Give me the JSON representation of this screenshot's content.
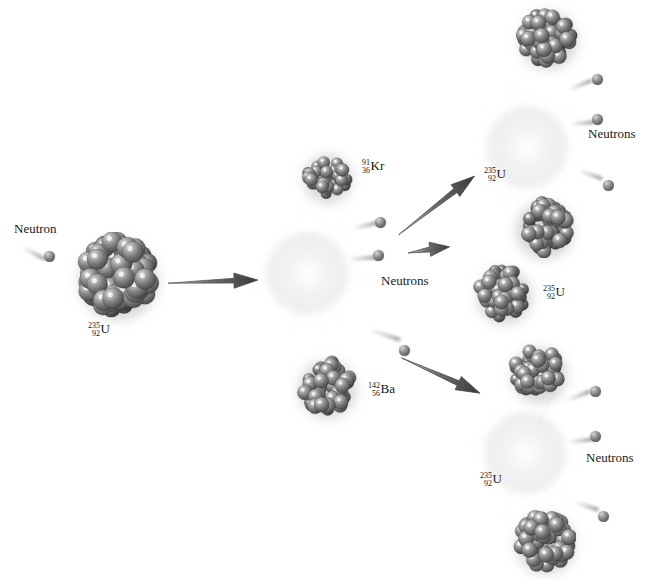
{
  "diagram": {
    "background_color": "#ffffff",
    "nucleus_color": "#6f6f6f",
    "neutron_color": "#7a7a7a",
    "burst_color": "#e6e6e6",
    "text_color": "#1a1a1a"
  },
  "labels": {
    "neutron_incoming": "Neutron",
    "neutrons_center": "Neutrons",
    "neutrons_top_right": "Neutrons",
    "neutrons_bottom_right": "Neutrons"
  },
  "isotopes": {
    "u235_source": {
      "mass": "235",
      "atomic": "92",
      "symbol": "U"
    },
    "kr91": {
      "mass": "91",
      "atomic": "36",
      "symbol": "Kr"
    },
    "ba142": {
      "mass": "142",
      "atomic": "56",
      "symbol": "Ba"
    },
    "u235_top": {
      "mass": "235",
      "atomic": "92",
      "symbol": "U"
    },
    "u235_middle": {
      "mass": "235",
      "atomic": "92",
      "symbol": "U"
    },
    "u235_bottom": {
      "mass": "235",
      "atomic": "92",
      "symbol": "U"
    }
  },
  "stages": [
    {
      "name": "incident-neutron",
      "description": "A free neutron travels toward a Uranium-235 nucleus"
    },
    {
      "name": "first-fission",
      "description": "U-235 absorbs the neutron and splits into Kr-91 and Ba-142, releasing 3 neutrons"
    },
    {
      "name": "second-generation",
      "description": "Released neutrons strike further U-235 nuclei causing two more fissions, each releasing 3 neutrons"
    }
  ]
}
